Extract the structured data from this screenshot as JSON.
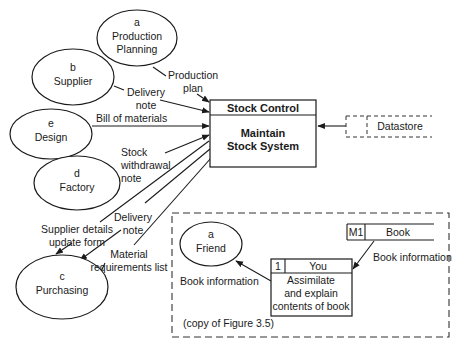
{
  "entities": [
    {
      "id": "a",
      "letter": "a",
      "line1": "Production",
      "line2": "Planning",
      "cx": 137,
      "cy": 38,
      "rx": 40,
      "ry": 28
    },
    {
      "id": "b",
      "letter": "b",
      "line1": "Supplier",
      "line2": "",
      "cx": 73,
      "cy": 77,
      "rx": 41,
      "ry": 28
    },
    {
      "id": "e",
      "letter": "e",
      "line1": "Design",
      "line2": "",
      "cx": 51,
      "cy": 134,
      "rx": 41,
      "ry": 25
    },
    {
      "id": "d",
      "letter": "d",
      "line1": "Factory",
      "line2": "",
      "cx": 77,
      "cy": 183,
      "rx": 43,
      "ry": 27
    },
    {
      "id": "c",
      "letter": "c",
      "line1": "Purchasing",
      "line2": "",
      "cx": 62,
      "cy": 287,
      "rx": 46,
      "ry": 32
    }
  ],
  "process": {
    "header": "Stock Control",
    "line1": "Maintain",
    "line2": "Stock System"
  },
  "datastore": {
    "label": "Datastore"
  },
  "flows": {
    "production_plan": [
      "Production",
      "plan"
    ],
    "delivery_note_1": [
      "Delivery",
      "note"
    ],
    "bill_of_materials": [
      "Bill of materials"
    ],
    "stock_withdrawal": [
      "Stock",
      "withdrawal",
      "note"
    ],
    "delivery_note_2": [
      "Delivery",
      "note"
    ],
    "supplier_details": [
      "Supplier details",
      "update form"
    ],
    "material_req": [
      "Material",
      "requirements list"
    ]
  },
  "inset": {
    "friend": {
      "letter": "a",
      "label": "Friend"
    },
    "you_box": {
      "id": "1",
      "header": "You",
      "line1": "Assimilate",
      "line2": "and explain",
      "line3": "contents of book"
    },
    "book_store": {
      "id": "M1",
      "label": "Book"
    },
    "flow_left": "Book information",
    "flow_right": "Book information",
    "caption": "(copy of Figure 3.5)"
  }
}
